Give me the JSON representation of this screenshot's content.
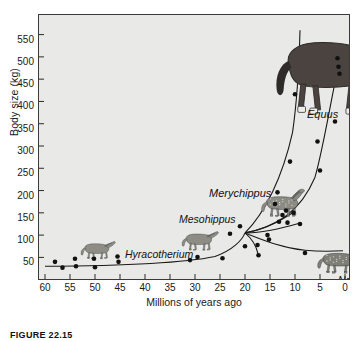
{
  "figure": {
    "caption": "FIGURE 22.15"
  },
  "chart_data": {
    "type": "scatter",
    "title": "",
    "xlabel": "Millions of years ago",
    "ylabel": "Body size (kg)",
    "xlim": [
      60,
      0
    ],
    "ylim": [
      15,
      585
    ],
    "x_ticks": [
      60,
      55,
      50,
      45,
      40,
      35,
      30,
      25,
      20,
      15,
      10,
      5,
      0
    ],
    "y_ticks": [
      50,
      100,
      150,
      200,
      250,
      300,
      350,
      400,
      450,
      500,
      550
    ],
    "x_axis_reversed": true,
    "grid": false,
    "legend": false,
    "background_color": "#e9e9e7",
    "point_color": "#111111",
    "line_color": "#1a1a1a",
    "points": [
      {
        "x": 58.0,
        "y": 40
      },
      {
        "x": 56.5,
        "y": 27
      },
      {
        "x": 54.0,
        "y": 47
      },
      {
        "x": 53.8,
        "y": 30
      },
      {
        "x": 50.2,
        "y": 47
      },
      {
        "x": 50.0,
        "y": 28
      },
      {
        "x": 45.5,
        "y": 52
      },
      {
        "x": 45.3,
        "y": 40
      },
      {
        "x": 31.0,
        "y": 44
      },
      {
        "x": 29.5,
        "y": 51
      },
      {
        "x": 24.5,
        "y": 48
      },
      {
        "x": 23.0,
        "y": 103
      },
      {
        "x": 21.0,
        "y": 120
      },
      {
        "x": 20.0,
        "y": 75
      },
      {
        "x": 17.5,
        "y": 78
      },
      {
        "x": 17.3,
        "y": 55
      },
      {
        "x": 15.5,
        "y": 100
      },
      {
        "x": 15.2,
        "y": 90
      },
      {
        "x": 14.0,
        "y": 170
      },
      {
        "x": 13.5,
        "y": 196
      },
      {
        "x": 13.2,
        "y": 130
      },
      {
        "x": 12.5,
        "y": 145
      },
      {
        "x": 11.8,
        "y": 155
      },
      {
        "x": 11.5,
        "y": 128
      },
      {
        "x": 11.0,
        "y": 265
      },
      {
        "x": 10.3,
        "y": 150
      },
      {
        "x": 10.0,
        "y": 416
      },
      {
        "x": 9.0,
        "y": 125
      },
      {
        "x": 8.0,
        "y": 60
      },
      {
        "x": 5.5,
        "y": 310
      },
      {
        "x": 5.0,
        "y": 245
      },
      {
        "x": 2.0,
        "y": 355
      },
      {
        "x": 1.5,
        "y": 497
      },
      {
        "x": 1.3,
        "y": 478
      },
      {
        "x": 1.1,
        "y": 462
      }
    ],
    "lineages": [
      {
        "name": "basal-to-node",
        "description": "gradual rise from Hyracotherium baseline to the branching node"
      },
      {
        "name": "Equus",
        "description": "steep rise to modern horse near 500 kg"
      },
      {
        "name": "Equus-secondary",
        "description": "second steep branch rising after 15 Mya"
      },
      {
        "name": "Merychippus-branch",
        "description": "short branch rising to about 150 kg"
      },
      {
        "name": "Nannippus",
        "description": "branch staying low near 60-70 kg"
      }
    ],
    "annotations": [
      {
        "label": "Hyracotherium",
        "x": 48.0,
        "y": 68,
        "style": "italic"
      },
      {
        "label": "Mesohippus",
        "x": 37.0,
        "y": 117,
        "style": "italic"
      },
      {
        "label": "Merychippus",
        "x": 30.0,
        "y": 205,
        "style": "italic"
      },
      {
        "label": "Equus",
        "x": 10.5,
        "y": 432,
        "style": "italic"
      },
      {
        "label": "Nannippus",
        "x": 2.8,
        "y": 37,
        "style": "italic"
      }
    ],
    "illustrations": [
      {
        "name": "hyracotherium-illustration",
        "label": "Hyracotherium"
      },
      {
        "name": "mesohippus-illustration",
        "label": "Mesohippus"
      },
      {
        "name": "merychippus-illustration",
        "label": "Merychippus"
      },
      {
        "name": "equus-illustration",
        "label": "Equus"
      },
      {
        "name": "nannippus-illustration",
        "label": "Nannippus"
      }
    ]
  }
}
